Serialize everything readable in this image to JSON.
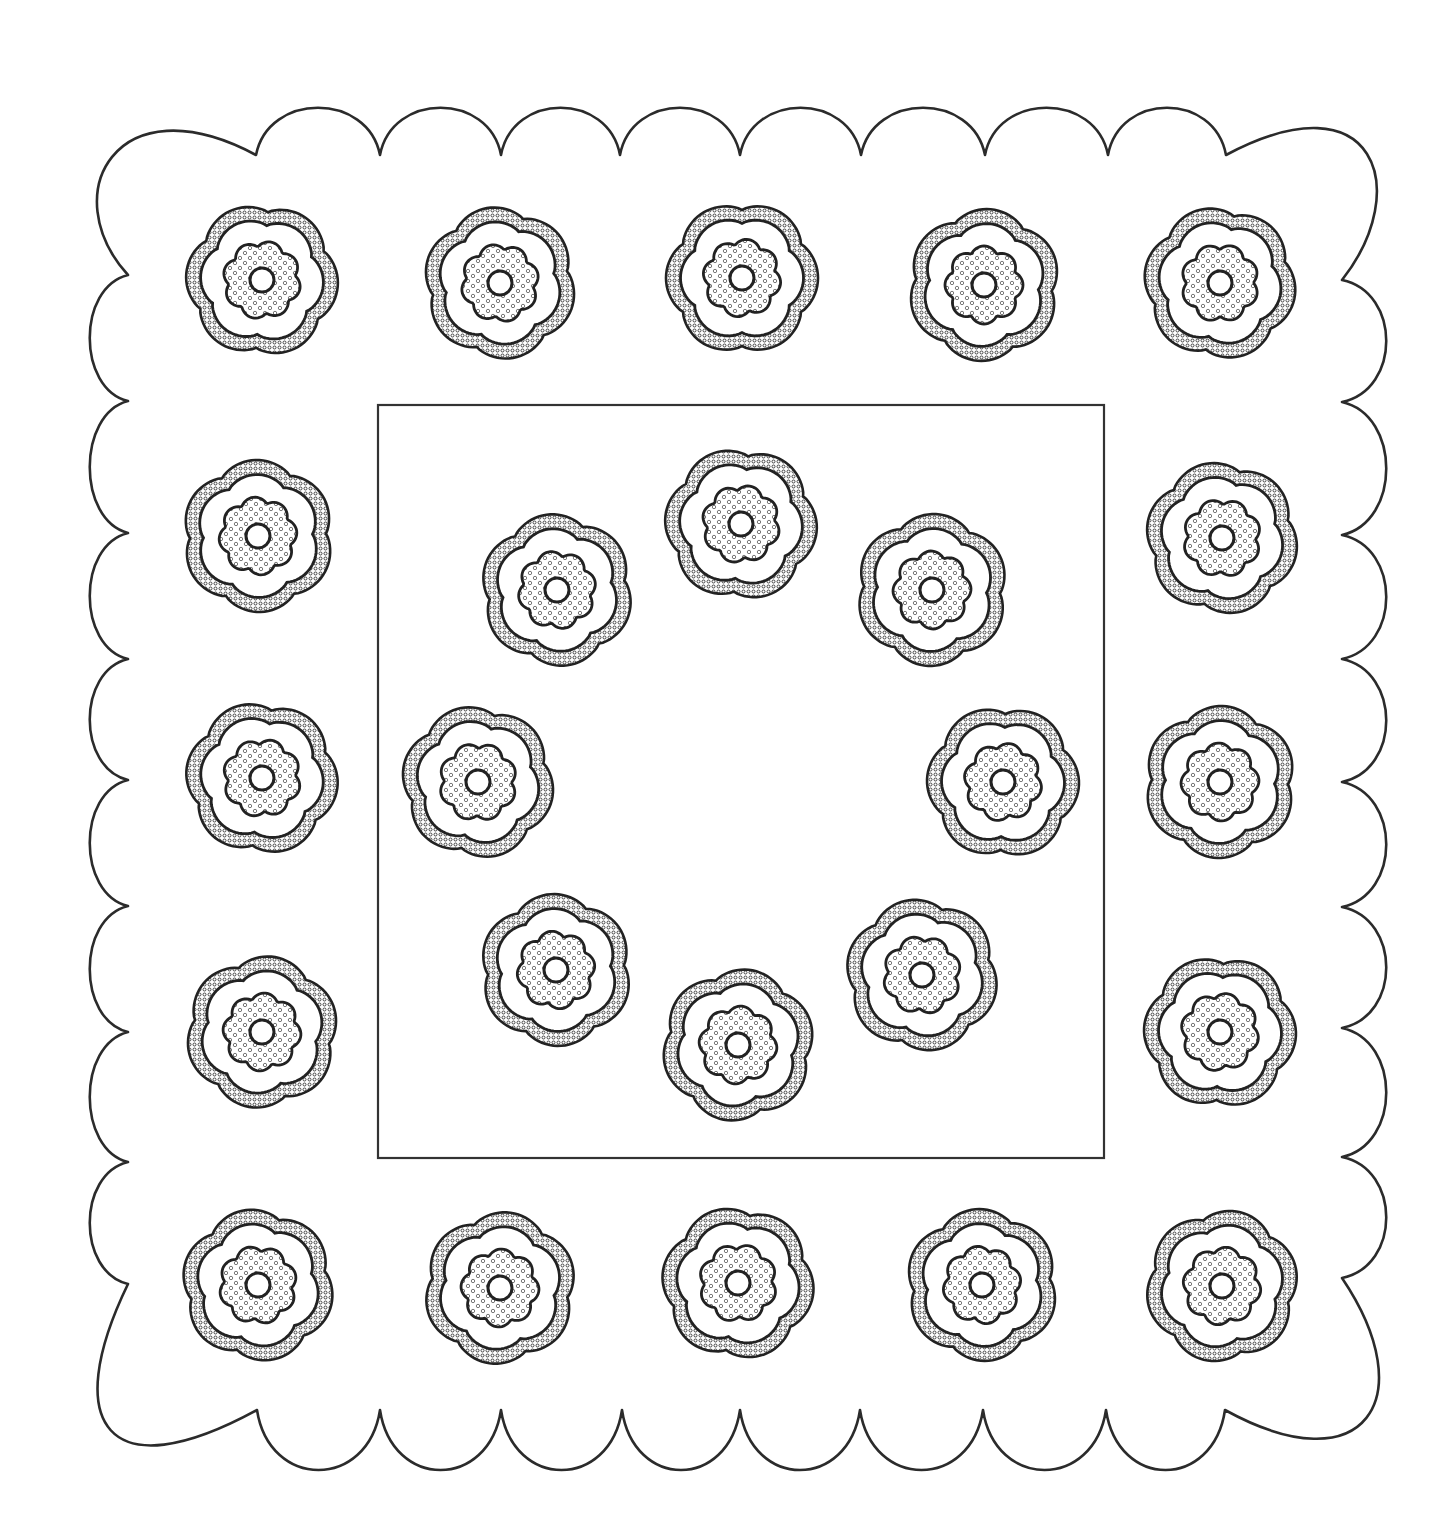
{
  "page": {
    "width": 1444,
    "height": 1525,
    "background": "#ffffff",
    "ink": "#222222"
  },
  "border": {
    "kind": "scalloped-frame",
    "top": {
      "notch_y": 155,
      "crest_y": 100,
      "notches_x": [
        256,
        380,
        501,
        620,
        740,
        861,
        985,
        1108,
        1226
      ]
    },
    "bottom": {
      "notch_y": 1410,
      "crest_y": 1482,
      "notches_x": [
        257,
        380,
        501,
        622,
        740,
        860,
        983,
        1106,
        1225
      ]
    },
    "left": {
      "notch_x": 128,
      "crest_x": 85,
      "notches_y": [
        275,
        401,
        533,
        659,
        780,
        906,
        1032,
        1162,
        1284
      ]
    },
    "right": {
      "notch_x": 1342,
      "crest_x": 1393,
      "notches_y": [
        280,
        402,
        535,
        659,
        782,
        907,
        1028,
        1157,
        1278
      ]
    }
  },
  "inner_frame": {
    "x": 378,
    "y": 405,
    "width": 726,
    "height": 753
  },
  "flower_style": {
    "outer_radius": 75,
    "ring_inner_radius": 61,
    "core_radius": 38,
    "eye_radius": 12,
    "outer_lobes": 6,
    "core_lobes": 8
  },
  "flowers": {
    "outer_border": [
      {
        "id": "top-1",
        "cx": 262,
        "cy": 280,
        "rot": 5
      },
      {
        "id": "top-2",
        "cx": 500,
        "cy": 283,
        "rot": 20
      },
      {
        "id": "top-3",
        "cx": 742,
        "cy": 278,
        "rot": 0
      },
      {
        "id": "top-4",
        "cx": 984,
        "cy": 285,
        "rot": 35
      },
      {
        "id": "top-5",
        "cx": 1220,
        "cy": 283,
        "rot": 12
      },
      {
        "id": "left-1",
        "cx": 258,
        "cy": 536,
        "rot": 28
      },
      {
        "id": "left-2",
        "cx": 262,
        "cy": 778,
        "rot": 8
      },
      {
        "id": "left-3",
        "cx": 262,
        "cy": 1032,
        "rot": 40
      },
      {
        "id": "right-1",
        "cx": 1222,
        "cy": 538,
        "rot": 15
      },
      {
        "id": "right-2",
        "cx": 1220,
        "cy": 782,
        "rot": 32
      },
      {
        "id": "right-3",
        "cx": 1220,
        "cy": 1032,
        "rot": 3
      },
      {
        "id": "bottom-1",
        "cx": 258,
        "cy": 1285,
        "rot": 18
      },
      {
        "id": "bottom-2",
        "cx": 500,
        "cy": 1288,
        "rot": 38
      },
      {
        "id": "bottom-3",
        "cx": 738,
        "cy": 1283,
        "rot": 10
      },
      {
        "id": "bottom-4",
        "cx": 982,
        "cy": 1285,
        "rot": 25
      },
      {
        "id": "bottom-5",
        "cx": 1222,
        "cy": 1286,
        "rot": 44
      }
    ],
    "inner_ring": [
      {
        "id": "inner-1",
        "cx": 557,
        "cy": 590,
        "rot": 22
      },
      {
        "id": "inner-2",
        "cx": 741,
        "cy": 524,
        "rot": 6
      },
      {
        "id": "inner-3",
        "cx": 932,
        "cy": 590,
        "rot": 33
      },
      {
        "id": "inner-4",
        "cx": 478,
        "cy": 782,
        "rot": 14
      },
      {
        "id": "inner-5",
        "cx": 1003,
        "cy": 782,
        "rot": 2
      },
      {
        "id": "inner-6",
        "cx": 556,
        "cy": 970,
        "rot": 26
      },
      {
        "id": "inner-7",
        "cx": 738,
        "cy": 1045,
        "rot": 41
      },
      {
        "id": "inner-8",
        "cx": 922,
        "cy": 975,
        "rot": 17
      }
    ]
  }
}
